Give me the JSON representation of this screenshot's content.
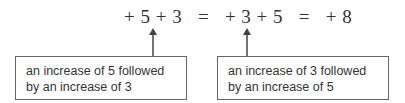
{
  "equation": {
    "text": "+ 5 + 3   =   + 3 + 5   =   + 8"
  },
  "annotations": [
    {
      "line1": "an increase of 5 followed",
      "line2": "by an increase of 3",
      "points_to": "first plus sign between 5 and 3"
    },
    {
      "line1": "an increase of 3 followed",
      "line2": "by an increase of 5",
      "points_to": "plus sign between 3 and 5"
    }
  ],
  "colors": {
    "text": "#333333",
    "border": "#666666",
    "arrow": "#444444"
  }
}
